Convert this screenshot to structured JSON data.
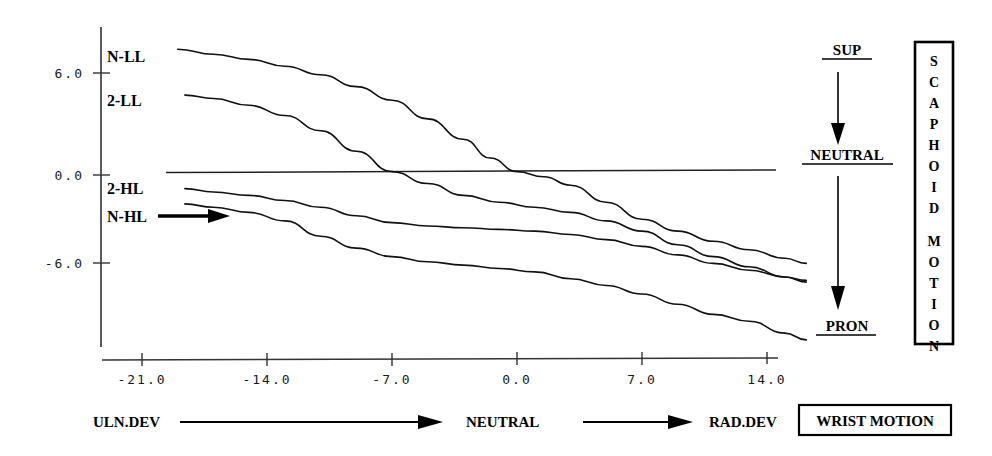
{
  "chart_data": {
    "type": "line",
    "title": "",
    "xlabel": "WRIST MOTION",
    "ylabel": "SCAPHOID MOTION",
    "xlim": [
      -24.5,
      17.5
    ],
    "ylim": [
      -11.0,
      9.0
    ],
    "grid": false,
    "legend_position": "inline-left",
    "xticks": [
      -21.0,
      -14.0,
      -7.0,
      0.0,
      7.0,
      14.0
    ],
    "xtick_labels": [
      "-21.0",
      "-14.0",
      "-7.0",
      "0.0",
      "7.0",
      "14.0"
    ],
    "yticks": [
      6.0,
      0.0,
      -6.0
    ],
    "ytick_labels": [
      "6.0",
      "0.0",
      "-6.0"
    ],
    "reference_line_y": 0.0,
    "series": [
      {
        "name": "N-LL",
        "label": "N-LL",
        "x": [
          -19.0,
          -17.0,
          -15.0,
          -13.0,
          -11.0,
          -9.0,
          -7.0,
          -5.0,
          -3.0,
          -1.5,
          0.0,
          1.5,
          3.0,
          5.0,
          7.0,
          9.0,
          11.0,
          13.0,
          15.0,
          16.2
        ],
        "y": [
          7.4,
          7.1,
          6.8,
          6.4,
          5.9,
          5.2,
          4.4,
          3.3,
          2.1,
          1.0,
          0.2,
          -0.1,
          -0.6,
          -1.6,
          -2.6,
          -3.3,
          -3.9,
          -4.4,
          -4.9,
          -5.2
        ]
      },
      {
        "name": "2-LL",
        "label": "2-LL",
        "x": [
          -18.6,
          -17.0,
          -15.0,
          -13.0,
          -11.0,
          -9.0,
          -7.0,
          -5.0,
          -3.0,
          -1.0,
          1.0,
          3.0,
          5.0,
          7.0,
          9.0,
          11.0,
          13.0,
          15.0,
          16.2
        ],
        "y": [
          4.7,
          4.5,
          4.1,
          3.5,
          2.6,
          1.4,
          0.2,
          -0.5,
          -1.2,
          -1.6,
          -1.9,
          -2.2,
          -2.7,
          -3.3,
          -4.1,
          -4.8,
          -5.4,
          -6.0,
          -6.3
        ]
      },
      {
        "name": "2-HL",
        "label": "2-HL",
        "x": [
          -18.6,
          -17.0,
          -15.0,
          -13.0,
          -11.0,
          -9.0,
          -7.0,
          -5.0,
          -3.0,
          -1.0,
          1.0,
          3.0,
          5.0,
          7.0,
          9.0,
          11.0,
          13.0,
          15.0,
          16.2
        ],
        "y": [
          -0.8,
          -1.0,
          -1.2,
          -1.5,
          -1.9,
          -2.4,
          -2.8,
          -3.0,
          -3.1,
          -3.2,
          -3.3,
          -3.5,
          -3.8,
          -4.2,
          -4.7,
          -5.2,
          -5.6,
          -6.0,
          -6.2
        ]
      },
      {
        "name": "N-HL",
        "label": "N-HL",
        "x": [
          -18.6,
          -17.0,
          -15.0,
          -13.0,
          -11.0,
          -9.0,
          -7.0,
          -5.0,
          -3.0,
          -1.0,
          1.0,
          3.0,
          5.0,
          7.0,
          9.0,
          11.0,
          13.0,
          15.0,
          16.2
        ],
        "y": [
          -1.7,
          -1.9,
          -2.2,
          -2.7,
          -3.6,
          -4.3,
          -4.8,
          -5.1,
          -5.3,
          -5.5,
          -5.7,
          -6.1,
          -6.5,
          -7.0,
          -7.6,
          -8.2,
          -8.6,
          -9.3,
          -9.7
        ]
      }
    ],
    "annotations": [
      {
        "name": "n-hl-pointer",
        "text": "",
        "type": "arrow"
      }
    ]
  },
  "y_axis": {
    "name": "scaphoid-motion-axis",
    "ticks": [
      {
        "value": 6.0,
        "label": "6.0"
      },
      {
        "value": 0.0,
        "label": "0.0"
      },
      {
        "value": -6.0,
        "label": "-6.0"
      }
    ]
  },
  "x_axis": {
    "name": "wrist-motion-axis",
    "ticks": [
      {
        "value": -21.0,
        "label": "-21.0"
      },
      {
        "value": -14.0,
        "label": "-14.0"
      },
      {
        "value": -7.0,
        "label": "-7.0"
      },
      {
        "value": 0.0,
        "label": "0.0"
      },
      {
        "value": 7.0,
        "label": "7.0"
      },
      {
        "value": 14.0,
        "label": "14.0"
      }
    ]
  },
  "curve_labels": [
    {
      "key": "n_ll",
      "text": "N-LL"
    },
    {
      "key": "two_ll",
      "text": "2-LL"
    },
    {
      "key": "two_hl",
      "text": "2-HL"
    },
    {
      "key": "n_hl",
      "text": "N-HL"
    }
  ],
  "forearm_panel": {
    "top_label": "SUP",
    "middle_label": "NEUTRAL",
    "bottom_label": "PRON"
  },
  "scaphoid_box": {
    "text": "SCAPHOID MOTION",
    "letters": [
      "S",
      "C",
      "A",
      "P",
      "H",
      "O",
      "I",
      "D",
      "M",
      "O",
      "T",
      "I",
      "O",
      "N"
    ]
  },
  "bottom_caption": {
    "left_label": "ULN.DEV",
    "middle_label": "NEUTRAL",
    "right_label": "RAD.DEV",
    "box_label": "WRIST MOTION"
  },
  "colors": {
    "ink": "#000000",
    "curve": "#111111",
    "axis": "#333333",
    "background": "#ffffff"
  }
}
